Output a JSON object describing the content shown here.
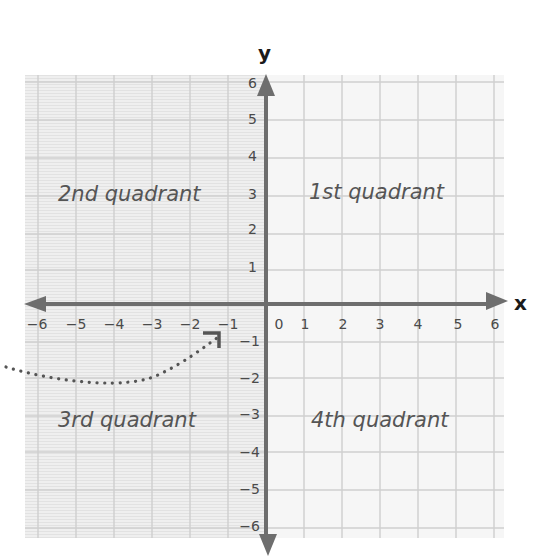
{
  "diagram": {
    "type": "coordinate_plane",
    "axes": {
      "x_label": "x",
      "y_label": "y",
      "x_range": [
        -6,
        6
      ],
      "y_range": [
        -6,
        6
      ],
      "x_ticks_negative": [
        "−6",
        "−5",
        "−4",
        "−3",
        "−2",
        "−1"
      ],
      "x_ticks_positive": [
        "1",
        "2",
        "3",
        "4",
        "5",
        "6"
      ],
      "origin_label": "0",
      "y_ticks_positive": [
        "6",
        "5",
        "4",
        "3",
        "2",
        "1"
      ],
      "y_ticks_negative": [
        "−1",
        "−2",
        "−3",
        "−4",
        "−5",
        "−6"
      ]
    },
    "quadrants": {
      "first": "1st quadrant",
      "second": "2nd quadrant",
      "third": "3rd quadrant",
      "fourth": "4th quadrant"
    },
    "annotation": {
      "description": "Dotted curved pointer leading from the left edge to a corner marker near (−1.3, −0.8)",
      "target_point": [
        -1.3,
        -0.8
      ]
    },
    "colors": {
      "axis": "#6e6e6e",
      "grid": "#cfcfcf",
      "paper_left": "#efefef",
      "paper_right": "#f7f7f7",
      "label_text": "#555555",
      "dots": "#555555"
    }
  }
}
